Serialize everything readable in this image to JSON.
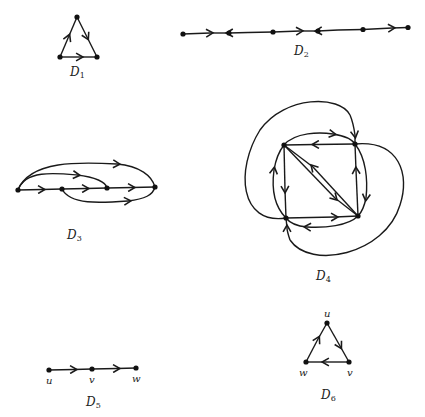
{
  "figure": {
    "diagrams": [
      {
        "id": "D1",
        "label": "D",
        "subscript": "1",
        "vertices": 3,
        "edges": 3
      },
      {
        "id": "D2",
        "label": "D",
        "subscript": "2",
        "vertices": 6,
        "edges": 5,
        "arrow_directions": [
          "right",
          "left",
          "right",
          "left",
          "right"
        ]
      },
      {
        "id": "D3",
        "label": "D",
        "subscript": "3",
        "vertices": 4,
        "edges": 6
      },
      {
        "id": "D4",
        "label": "D",
        "subscript": "4",
        "vertices": 4
      },
      {
        "id": "D5",
        "label": "D",
        "subscript": "5",
        "vertex_labels": [
          "u",
          "v",
          "w"
        ]
      },
      {
        "id": "D6",
        "label": "D",
        "subscript": "6",
        "vertex_labels": [
          "u",
          "v",
          "w"
        ]
      }
    ]
  },
  "colors": {
    "ink": "#1a1a1a",
    "background": "#ffffff"
  }
}
